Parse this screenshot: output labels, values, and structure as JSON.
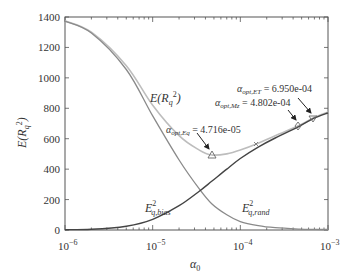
{
  "chart_data": {
    "type": "line",
    "title": "",
    "xlabel": "α0",
    "ylabel": "E(R_q^2)",
    "xscale": "log",
    "xlim": [
      1e-06,
      0.001
    ],
    "ylim": [
      0,
      1400
    ],
    "grid": false,
    "legend": "none (inline curve labels)",
    "x_ticks": [
      "10^-6",
      "10^-5",
      "10^-4",
      "10^-3"
    ],
    "y_ticks": [
      0,
      200,
      400,
      600,
      800,
      1000,
      1200,
      1400
    ],
    "x": [
      1e-06,
      2e-06,
      5e-06,
      1e-05,
      2e-05,
      3.4e-05,
      4.716e-05,
      7e-05,
      0.0001,
      0.00016,
      0.00025,
      0.0004802,
      0.000695,
      0.001
    ],
    "series": [
      {
        "name": "E(R_q^2)",
        "color": "#b8b8b8",
        "values": [
          1375,
          1300,
          1080,
          820,
          620,
          525,
          493,
          500,
          525,
          570,
          620,
          690,
          740,
          775
        ]
      },
      {
        "name": "E_q,bias^2",
        "color": "#444444",
        "values": [
          2,
          5,
          25,
          70,
          160,
          255,
          320,
          400,
          470,
          545,
          605,
          685,
          735,
          770
        ]
      },
      {
        "name": "E_q,rand^2",
        "color": "#888888",
        "values": [
          1373,
          1295,
          1055,
          750,
          460,
          270,
          173,
          100,
          55,
          28,
          15,
          6,
          4,
          3
        ]
      }
    ],
    "markers": [
      {
        "label": "α_opt,Eq = 4.716e-05",
        "x": 4.716e-05,
        "y": 493,
        "shape": "triangle-up"
      },
      {
        "label": "",
        "x": 0.000155,
        "y": 565,
        "shape": "x"
      },
      {
        "label": "α_opt,Mz = 4.802e-04",
        "x": 0.0004802,
        "y": 690,
        "shape": "diamond"
      },
      {
        "label": "α_opt,ET = 6.950e-04",
        "x": 0.000695,
        "y": 738,
        "shape": "triangle-down"
      }
    ],
    "annotations": [
      "E(R_q^2)",
      "E_q,bias^2",
      "E_q,rand^2",
      "α_opt,Eq = 4.716e-05",
      "α_opt,Mz = 4.802e-04",
      "α_opt,ET = 6.950e-04"
    ]
  },
  "labels": {
    "y_axis": "E(R",
    "x_axis": "α",
    "x_axis_sub": "0",
    "curve_total": "E(R",
    "curve_bias_base": "E",
    "curve_bias_sub": "q,bias",
    "curve_rand_base": "E",
    "curve_rand_sub": "q,rand",
    "sup2": "2",
    "q": "q",
    "ann_eq_base": "α",
    "ann_eq_sub": "opt,Eq",
    "ann_eq_val": " = 4.716e-05",
    "ann_mz_base": "α",
    "ann_mz_sub": "opt,Mz",
    "ann_mz_val": " = 4.802e-04",
    "ann_et_base": "α",
    "ann_et_sub": "opt,ET",
    "ann_et_val": " = 6.950e-04"
  },
  "ticks": {
    "y": [
      "0",
      "200",
      "400",
      "600",
      "800",
      "1000",
      "1200",
      "1400"
    ],
    "x_base": [
      "10",
      "10",
      "10",
      "10"
    ],
    "x_exp": [
      "−6",
      "−5",
      "−4",
      "−3"
    ]
  }
}
